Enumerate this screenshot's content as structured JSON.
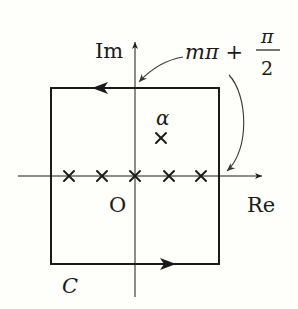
{
  "diagram": {
    "type": "complex-plane contour",
    "colors": {
      "background": "#fefefa",
      "ink": "#1a1a1a",
      "pointer": "#333333"
    },
    "axes": {
      "imag_label": "Im",
      "real_label": "Re",
      "origin_label": "O"
    },
    "contour": {
      "label": "C",
      "shape": "square",
      "orientation": "counterclockwise"
    },
    "annotation": {
      "main": "mπ +",
      "numerator": "π",
      "denominator": "2"
    },
    "points": {
      "alpha_label": "α",
      "real_axis_crosses": 5,
      "off_axis_crosses": 1
    }
  }
}
